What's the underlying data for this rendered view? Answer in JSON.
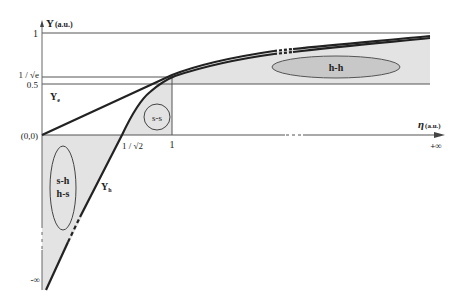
{
  "diagram": {
    "y_axis_label": "Y",
    "y_axis_unit": "(a.u.)",
    "x_axis_label": "η",
    "x_axis_unit": "(a.u.)",
    "y_ticks": {
      "one": "1",
      "inv_sqrt_e": "1 / √e",
      "half": "0.5",
      "origin": "(0,0)",
      "neg_inf": "-∞"
    },
    "x_ticks": {
      "inv_sqrt2": "1 / √2",
      "one": "1",
      "pos_inf": "+∞"
    },
    "curves": {
      "ye_label": "Y",
      "ye_sub": "e",
      "yh_label": "Y",
      "yh_sub": "h"
    },
    "regions": {
      "ss": "s-s",
      "sh": "s-h",
      "hs": "h-s",
      "hh": "h-h"
    },
    "colors": {
      "shade": "#e3e3e3",
      "ellipse_hh": "#c8c8c8",
      "line": "#222222",
      "grid": "#555555"
    }
  }
}
